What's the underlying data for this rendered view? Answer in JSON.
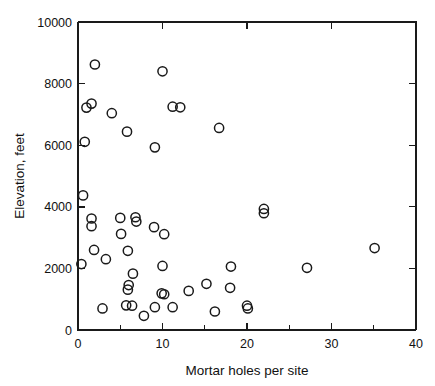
{
  "chart_data": {
    "type": "scatter",
    "title": "",
    "xlabel": "Mortar holes per site",
    "ylabel": "Elevation, feet",
    "xlim": [
      0,
      40
    ],
    "ylim": [
      0,
      10000
    ],
    "grid": false,
    "legend": null,
    "xticks": [
      0,
      10,
      20,
      30,
      40
    ],
    "yticks": [
      0,
      2000,
      4000,
      6000,
      8000,
      10000
    ],
    "xtick_labels": [
      "0",
      "10",
      "20",
      "30",
      "40"
    ],
    "ytick_labels": [
      "0",
      "2000",
      "4000",
      "6000",
      "8000",
      "10000"
    ],
    "x_minor_ticks": [
      5,
      15,
      25,
      35
    ],
    "y_minor_ticks": [
      1000,
      3000,
      5000,
      7000,
      9000
    ],
    "marker": "open-circle",
    "marker_color": "#1a1a1a",
    "points": [
      {
        "x": 2.0,
        "y": 8620
      },
      {
        "x": 10.0,
        "y": 8400
      },
      {
        "x": 1.6,
        "y": 7350
      },
      {
        "x": 1.0,
        "y": 7220
      },
      {
        "x": 11.2,
        "y": 7250
      },
      {
        "x": 12.1,
        "y": 7230
      },
      {
        "x": 4.0,
        "y": 7040
      },
      {
        "x": 16.7,
        "y": 6560
      },
      {
        "x": 5.8,
        "y": 6440
      },
      {
        "x": 0.8,
        "y": 6110
      },
      {
        "x": 9.1,
        "y": 5930
      },
      {
        "x": 0.6,
        "y": 4370
      },
      {
        "x": 22.0,
        "y": 3930
      },
      {
        "x": 22.0,
        "y": 3790
      },
      {
        "x": 1.6,
        "y": 3620
      },
      {
        "x": 5.0,
        "y": 3640
      },
      {
        "x": 6.8,
        "y": 3660
      },
      {
        "x": 6.9,
        "y": 3520
      },
      {
        "x": 1.6,
        "y": 3370
      },
      {
        "x": 9.0,
        "y": 3340
      },
      {
        "x": 5.1,
        "y": 3120
      },
      {
        "x": 10.2,
        "y": 3110
      },
      {
        "x": 35.1,
        "y": 2660
      },
      {
        "x": 1.9,
        "y": 2600
      },
      {
        "x": 5.9,
        "y": 2570
      },
      {
        "x": 3.3,
        "y": 2300
      },
      {
        "x": 0.4,
        "y": 2140
      },
      {
        "x": 10.0,
        "y": 2080
      },
      {
        "x": 18.1,
        "y": 2060
      },
      {
        "x": 27.1,
        "y": 2020
      },
      {
        "x": 6.5,
        "y": 1830
      },
      {
        "x": 15.2,
        "y": 1500
      },
      {
        "x": 6.0,
        "y": 1460
      },
      {
        "x": 18.0,
        "y": 1370
      },
      {
        "x": 5.9,
        "y": 1310
      },
      {
        "x": 13.1,
        "y": 1270
      },
      {
        "x": 9.9,
        "y": 1190
      },
      {
        "x": 10.2,
        "y": 1160
      },
      {
        "x": 2.9,
        "y": 700
      },
      {
        "x": 5.7,
        "y": 800
      },
      {
        "x": 6.4,
        "y": 790
      },
      {
        "x": 9.1,
        "y": 740
      },
      {
        "x": 11.2,
        "y": 740
      },
      {
        "x": 16.2,
        "y": 600
      },
      {
        "x": 20.0,
        "y": 790
      },
      {
        "x": 20.1,
        "y": 700
      },
      {
        "x": 7.8,
        "y": 460
      }
    ]
  },
  "axes": {
    "x_title": "Mortar holes per site",
    "y_title": "Elevation, feet"
  }
}
